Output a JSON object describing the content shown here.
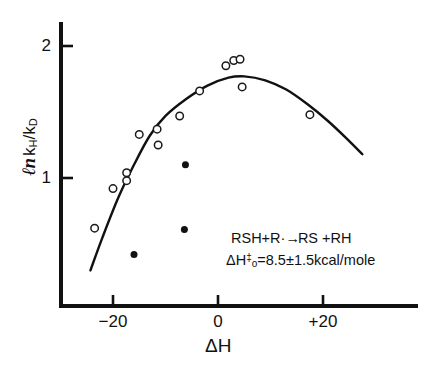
{
  "figure": {
    "background": "#ffffff",
    "ink_color": "#111111"
  },
  "axes": {
    "x": {
      "label": "ΔH",
      "ticks": [
        {
          "value": -20,
          "label": "−20",
          "px": 114
        },
        {
          "value": 0,
          "label": "0",
          "px": 218
        },
        {
          "value": 20,
          "label": "+20",
          "px": 323
        }
      ],
      "range": [
        -28,
        40
      ],
      "axis_px": {
        "x0": 61,
        "x1": 418,
        "y": 306
      }
    },
    "y": {
      "label_prefix": "ℓn",
      "label_main": "k",
      "label_sub_h": "H",
      "label_slash": "/k",
      "label_sub_d": "D",
      "label_full": "ℓn kH/kD",
      "ticks": [
        {
          "value": 1,
          "label": "1",
          "px": 178
        },
        {
          "value": 2,
          "label": "2",
          "px": 46
        }
      ],
      "range": [
        0,
        2.2
      ],
      "axis_px": {
        "y0": 22,
        "y1": 306,
        "x": 61
      }
    }
  },
  "annotation": {
    "reaction_a": "RSH+R·",
    "reaction_arrow": "→",
    "reaction_b": "RS +RH",
    "enthalpy_delta": "ΔH",
    "enthalpy_sup": "‡",
    "enthalpy_sub": "o",
    "enthalpy_value": "=8.5±1.5kcal/mole"
  },
  "chart_data": {
    "type": "scatter",
    "title": "",
    "xlabel": "ΔH",
    "ylabel": "ℓn kH/kD",
    "xlim": [
      -28,
      40
    ],
    "ylim": [
      0,
      2.2
    ],
    "grid": false,
    "legend_position": "none",
    "series": [
      {
        "name": "open-circles",
        "marker": "open-circle",
        "marker_size": 7.5,
        "color": "#1a1a1a",
        "points": [
          {
            "x": -23.5,
            "y": 0.62
          },
          {
            "x": -20.0,
            "y": 0.92
          },
          {
            "x": -17.4,
            "y": 1.04
          },
          {
            "x": -17.4,
            "y": 0.98
          },
          {
            "x": -15.0,
            "y": 1.33
          },
          {
            "x": -11.6,
            "y": 1.37
          },
          {
            "x": -11.4,
            "y": 1.25
          },
          {
            "x": -7.3,
            "y": 1.47
          },
          {
            "x": -3.5,
            "y": 1.66
          },
          {
            "x": 1.5,
            "y": 1.85
          },
          {
            "x": 3.0,
            "y": 1.89
          },
          {
            "x": 4.2,
            "y": 1.9
          },
          {
            "x": 4.6,
            "y": 1.69
          },
          {
            "x": 17.5,
            "y": 1.48
          }
        ]
      },
      {
        "name": "filled-circles",
        "marker": "filled-circle",
        "marker_size": 7.0,
        "color": "#111111",
        "points": [
          {
            "x": -16.0,
            "y": 0.42
          },
          {
            "x": -6.4,
            "y": 0.61
          },
          {
            "x": -6.2,
            "y": 1.1
          }
        ]
      }
    ],
    "fit_curve": {
      "name": "bell-shaped-fit",
      "description": "smooth inverted-parabola fit through open circles",
      "peak": {
        "x": 5.0,
        "y": 1.77
      },
      "points": [
        {
          "x": -24.3,
          "y": 0.3
        },
        {
          "x": -22.0,
          "y": 0.55
        },
        {
          "x": -19.0,
          "y": 0.85
        },
        {
          "x": -16.0,
          "y": 1.1
        },
        {
          "x": -13.0,
          "y": 1.32
        },
        {
          "x": -10.0,
          "y": 1.47
        },
        {
          "x": -6.0,
          "y": 1.6
        },
        {
          "x": -2.0,
          "y": 1.7
        },
        {
          "x": 2.0,
          "y": 1.76
        },
        {
          "x": 5.0,
          "y": 1.77
        },
        {
          "x": 9.0,
          "y": 1.74
        },
        {
          "x": 13.0,
          "y": 1.67
        },
        {
          "x": 17.0,
          "y": 1.56
        },
        {
          "x": 21.0,
          "y": 1.43
        },
        {
          "x": 25.0,
          "y": 1.28
        },
        {
          "x": 27.5,
          "y": 1.18
        }
      ]
    }
  }
}
